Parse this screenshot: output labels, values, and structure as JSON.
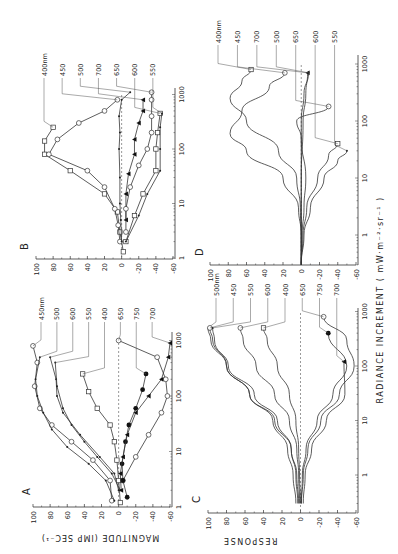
{
  "figure": {
    "axis_title_y": "MAGNITUDE (IMP SEC⁻¹)",
    "axis_title_y2": "RESPONSE",
    "axis_title_x": "RADIANCE INCREMENT ( mW·m⁻²·sr⁻¹ )"
  },
  "chart_data": [
    {
      "panel": "A",
      "type": "line",
      "title": "A",
      "xlabel": "RADIANCE INCREMENT (mW·m⁻²·sr⁻¹)",
      "ylabel": "MAGNITUDE (IMP SEC⁻¹)",
      "xscale": "log",
      "xlim": [
        1,
        1000
      ],
      "ylim": [
        -60,
        100
      ],
      "yticks": [
        100,
        80,
        60,
        40,
        20,
        0,
        -20,
        -40,
        -60
      ],
      "xticks": [
        1,
        10,
        100,
        1000
      ],
      "zero_line": "dashed",
      "series": [
        {
          "name": "450nm",
          "marker": "open-circle",
          "x": [
            1.3,
            3,
            7,
            15,
            30,
            60,
            150,
            400,
            800
          ],
          "y": [
            8,
            10,
            30,
            55,
            78,
            92,
            98,
            95,
            100
          ]
        },
        {
          "name": "500",
          "marker": "dot",
          "x": [
            1.3,
            3,
            6,
            12,
            25,
            50,
            100,
            200,
            500
          ],
          "y": [
            5,
            15,
            35,
            60,
            78,
            88,
            95,
            97,
            92
          ]
        },
        {
          "name": "600",
          "marker": "dot",
          "x": [
            2,
            4,
            8,
            20,
            50,
            100,
            200,
            500
          ],
          "y": [
            0,
            5,
            22,
            45,
            65,
            72,
            73,
            80
          ]
        },
        {
          "name": "550",
          "marker": "dot",
          "x": [
            2,
            4,
            8,
            15,
            30,
            60,
            150,
            400
          ],
          "y": [
            -2,
            8,
            25,
            40,
            55,
            65,
            72,
            74
          ]
        },
        {
          "name": "400",
          "marker": "open-square",
          "x": [
            1.2,
            3,
            7,
            15,
            30,
            60,
            120,
            250
          ],
          "y": [
            -2,
            0,
            2,
            5,
            10,
            25,
            35,
            42
          ]
        },
        {
          "name": "650",
          "marker": "open-circle",
          "x": [
            3,
            8,
            20,
            50,
            100,
            200,
            500,
            1000
          ],
          "y": [
            -5,
            -20,
            -35,
            -50,
            -57,
            -55,
            -45,
            0
          ]
        },
        {
          "name": "750",
          "marker": "filled-circle",
          "x": [
            1.5,
            3,
            6,
            15,
            30,
            60,
            130,
            250
          ],
          "y": [
            -10,
            -5,
            -4,
            -8,
            -12,
            -20,
            -28,
            -32
          ]
        },
        {
          "name": "700",
          "marker": "filled-triangle",
          "x": [
            2,
            4,
            8,
            20,
            50,
            100,
            200,
            500,
            900
          ],
          "y": [
            -3,
            -2,
            -5,
            -10,
            -20,
            -35,
            -50,
            -58,
            -60
          ]
        }
      ]
    },
    {
      "panel": "B",
      "type": "line",
      "title": "B",
      "xlabel": "RADIANCE INCREMENT (mW·m⁻²·sr⁻¹)",
      "ylabel": "MAGNITUDE (IMP SEC⁻¹)",
      "xscale": "log",
      "xlim": [
        1,
        1000
      ],
      "ylim": [
        -60,
        100
      ],
      "yticks": [
        100,
        80,
        60,
        40,
        20,
        0,
        -20,
        -40,
        -60
      ],
      "xticks": [
        1,
        10,
        100,
        1000
      ],
      "zero_line": "dashed",
      "series": [
        {
          "name": "400nm",
          "marker": "open-square",
          "x": [
            1.3,
            3,
            7,
            15,
            40,
            80,
            140,
            250
          ],
          "y": [
            -2,
            2,
            5,
            20,
            60,
            90,
            90,
            80
          ]
        },
        {
          "name": "450",
          "marker": "open-circle",
          "x": [
            2,
            4,
            8,
            20,
            40,
            80,
            150,
            300,
            500,
            800
          ],
          "y": [
            2,
            4,
            8,
            20,
            40,
            85,
            75,
            50,
            20,
            5
          ]
        },
        {
          "name": "500",
          "marker": "dot",
          "x": [
            2,
            5,
            10,
            30,
            100,
            200,
            400,
            800,
            1100
          ],
          "y": [
            0,
            1,
            2,
            2,
            3,
            2,
            3,
            0,
            -10
          ]
        },
        {
          "name": "700",
          "marker": "filled-triangle",
          "x": [
            5,
            15,
            35,
            80,
            150,
            300,
            500,
            800
          ],
          "y": [
            -5,
            -5,
            -8,
            -15,
            -15,
            -20,
            -25,
            -25
          ]
        },
        {
          "name": "650",
          "marker": "open-circle",
          "x": [
            3,
            8,
            20,
            50,
            100,
            200,
            400,
            800,
            1100
          ],
          "y": [
            -5,
            -5,
            -10,
            -20,
            -30,
            -35,
            -35,
            -35,
            -35
          ]
        },
        {
          "name": "600",
          "marker": "open-square",
          "x": [
            2,
            6,
            15,
            40,
            100,
            200,
            450
          ],
          "y": [
            -5,
            -15,
            -25,
            -40,
            -40,
            -42,
            -45
          ]
        },
        {
          "name": "550",
          "marker": "dot",
          "x": [
            2,
            6,
            15,
            40,
            100,
            250,
            450
          ],
          "y": [
            -5,
            -20,
            -30,
            -45,
            -45,
            -45,
            -47
          ]
        }
      ]
    },
    {
      "panel": "C",
      "type": "line",
      "title": "C",
      "xlabel": "RADIANCE INCREMENT (mW·m⁻²·sr⁻¹)",
      "ylabel": "RESPONSE",
      "xscale": "log",
      "xlim": [
        0.3,
        1000
      ],
      "ylim": [
        -60,
        100
      ],
      "yticks": [
        100,
        80,
        60,
        40,
        20,
        0,
        -20,
        -40,
        -60
      ],
      "xticks": [
        1,
        10,
        100,
        1000
      ],
      "zero_line": "dashed",
      "series": [
        {
          "name": "500nm",
          "marker": "none",
          "x": [
            0.3,
            1,
            3,
            10,
            30,
            100,
            300,
            500
          ],
          "y": [
            5,
            8,
            14,
            30,
            55,
            80,
            97,
            100
          ]
        },
        {
          "name": "450",
          "marker": "open-circle",
          "x": [
            0.3,
            1,
            3,
            10,
            30,
            100,
            300,
            500
          ],
          "y": [
            3,
            5,
            10,
            25,
            50,
            78,
            95,
            98
          ]
        },
        {
          "name": "550",
          "marker": "dot",
          "x": [
            0.3,
            1,
            3,
            10,
            30,
            100,
            300,
            500
          ],
          "y": [
            2,
            4,
            10,
            28,
            55,
            80,
            93,
            95
          ]
        },
        {
          "name": "600",
          "marker": "open-circle",
          "x": [
            0.3,
            1,
            3,
            10,
            30,
            100,
            300,
            500
          ],
          "y": [
            1,
            2,
            4,
            12,
            28,
            48,
            62,
            65
          ]
        },
        {
          "name": "400",
          "marker": "open-square",
          "x": [
            0.3,
            1,
            3,
            10,
            30,
            100,
            300,
            500
          ],
          "y": [
            0,
            1,
            2,
            5,
            12,
            25,
            36,
            40
          ]
        },
        {
          "name": "650",
          "marker": "open-circle",
          "x": [
            0.3,
            1,
            3,
            10,
            30,
            100,
            300,
            800
          ],
          "y": [
            -1,
            -3,
            -8,
            -22,
            -42,
            -58,
            -50,
            -25
          ]
        },
        {
          "name": "750",
          "marker": "filled-circle",
          "x": [
            0.3,
            1,
            3,
            10,
            30,
            100,
            400
          ],
          "y": [
            -1,
            -2,
            -6,
            -18,
            -35,
            -50,
            -30
          ]
        },
        {
          "name": "700",
          "marker": "filled-triangle",
          "x": [
            0.3,
            1,
            3,
            10,
            30,
            120
          ],
          "y": [
            -3,
            -5,
            -12,
            -28,
            -48,
            -47
          ]
        }
      ]
    },
    {
      "panel": "D",
      "type": "line",
      "title": "D",
      "xlabel": "RADIANCE INCREMENT (mW·m⁻²·sr⁻¹)",
      "ylabel": "RESPONSE",
      "xscale": "log",
      "xlim": [
        0.3,
        1000
      ],
      "ylim": [
        -60,
        100
      ],
      "yticks": [
        100,
        80,
        60,
        40,
        20,
        0,
        -20,
        -40,
        -60
      ],
      "xticks": [
        1,
        10,
        100,
        1000
      ],
      "zero_line": "dashed",
      "series": [
        {
          "name": "400nm",
          "marker": "open-square",
          "x": [
            0.3,
            1,
            3,
            10,
            30,
            100,
            250,
            500,
            800
          ],
          "y": [
            0,
            0,
            1,
            5,
            25,
            60,
            78,
            65,
            55
          ]
        },
        {
          "name": "450",
          "marker": "open-circle",
          "x": [
            0.3,
            1,
            3,
            10,
            30,
            60,
            150,
            400,
            700
          ],
          "y": [
            0,
            0,
            3,
            20,
            60,
            78,
            65,
            35,
            18
          ]
        },
        {
          "name": "700",
          "marker": "filled-triangle",
          "x": [
            0.3,
            1,
            10,
            100,
            300,
            700
          ],
          "y": [
            0,
            0,
            0,
            -2,
            -5,
            -7
          ]
        },
        {
          "name": "500",
          "marker": "dot",
          "x": [
            0.3,
            1,
            10,
            100,
            300,
            700
          ],
          "y": [
            0,
            0,
            0,
            0,
            -3,
            -8
          ]
        },
        {
          "name": "650",
          "marker": "open-circle",
          "x": [
            0.3,
            1,
            3,
            10,
            50,
            100,
            180
          ],
          "y": [
            0,
            -1,
            -3,
            -5,
            0,
            5,
            -30
          ]
        },
        {
          "name": "600",
          "marker": "open-square",
          "x": [
            0.3,
            1,
            3,
            10,
            25,
            40
          ],
          "y": [
            0,
            -2,
            -6,
            -18,
            -30,
            -40
          ]
        },
        {
          "name": "550",
          "marker": "dot",
          "x": [
            0.3,
            1,
            3,
            10,
            20,
            30
          ],
          "y": [
            0,
            -3,
            -10,
            -25,
            -40,
            -50
          ]
        }
      ]
    }
  ]
}
